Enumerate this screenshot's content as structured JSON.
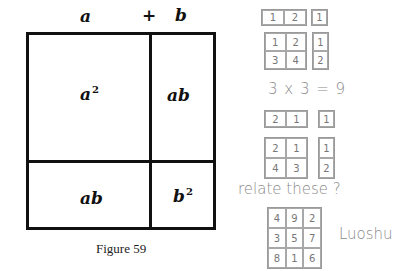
{
  "figure": {
    "top_labels": {
      "a": "a",
      "plus": "+",
      "b": "b"
    },
    "cells": {
      "a_squared": "a",
      "a_squared_exp": "2",
      "ab_top_right": "ab",
      "ab_bottom_left": "ab",
      "b_squared": "b",
      "b_squared_exp": "2"
    },
    "caption": "Figure 59"
  },
  "notes": {
    "group1": {
      "row_pair": [
        "1",
        "2"
      ],
      "row_single": "1",
      "grid": [
        [
          "1",
          "2"
        ],
        [
          "3",
          "4"
        ]
      ],
      "column": [
        "1",
        "2"
      ]
    },
    "equation": "3 x 3 = 9",
    "group2": {
      "row_pair": [
        "2",
        "1"
      ],
      "row_single": "1",
      "grid": [
        [
          "2",
          "1"
        ],
        [
          "4",
          "3"
        ]
      ],
      "column": [
        "1",
        "2"
      ]
    },
    "question": "relate these ?",
    "luoshu": {
      "grid": [
        [
          "4",
          "9",
          "2"
        ],
        [
          "3",
          "5",
          "7"
        ],
        [
          "8",
          "1",
          "6"
        ]
      ],
      "label": "Luoshu"
    }
  }
}
